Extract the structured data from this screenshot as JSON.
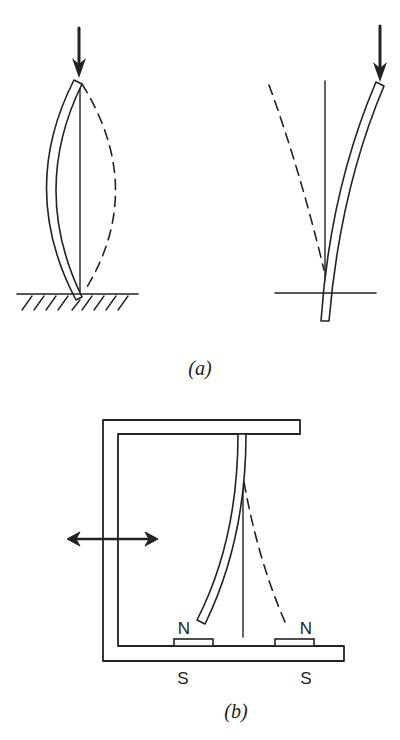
{
  "figure": {
    "panel_a": {
      "caption": "(a)",
      "left_diagram": {
        "description": "column with fixed base, buckled (solid) and opposite deflection (dashed), axial load arrow",
        "load_arrow": "down-arrow"
      },
      "right_diagram": {
        "description": "cantilever column through horizontal support line, deflected right (solid) and left (dashed), axial load arrow",
        "load_arrow": "down-arrow"
      }
    },
    "panel_b": {
      "caption": "(b)",
      "frame": "C-shaped frame with hanging flexible rod",
      "shake_arrow": "double-headed horizontal arrow",
      "magnets": [
        {
          "top_label": "N",
          "bottom_label": "S"
        },
        {
          "top_label": "N",
          "bottom_label": "S"
        }
      ]
    },
    "colors": {
      "ink": "#222222",
      "background": "#ffffff"
    }
  }
}
